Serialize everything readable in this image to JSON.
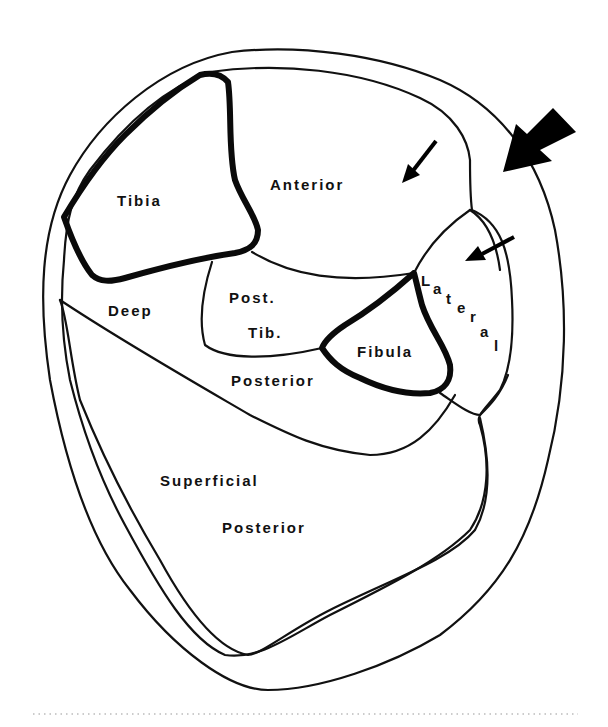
{
  "diagram": {
    "type": "anatomical cross-section of lower leg compartments",
    "labels": {
      "tibia": "Tibia",
      "anterior": "Anterior",
      "deep": "Deep",
      "post_tib_1": "Post.",
      "post_tib_2": "Tib.",
      "fibula": "Fibula",
      "posterior_deep": "Posterior",
      "superficial": "Superficial",
      "posterior_superficial": "Posterior",
      "lateral_letters": [
        "L",
        "a",
        "t",
        "e",
        "r",
        "a",
        "l"
      ]
    },
    "arrows": [
      {
        "name": "large-arrow",
        "direction": "down-left",
        "target": "anterolateral leg"
      },
      {
        "name": "small-arrow-anterior",
        "direction": "down-left",
        "target": "anterior compartment"
      },
      {
        "name": "small-arrow-lateral",
        "direction": "down-left",
        "target": "lateral compartment"
      }
    ],
    "colors": {
      "line": "#111111",
      "background": "#ffffff"
    }
  }
}
